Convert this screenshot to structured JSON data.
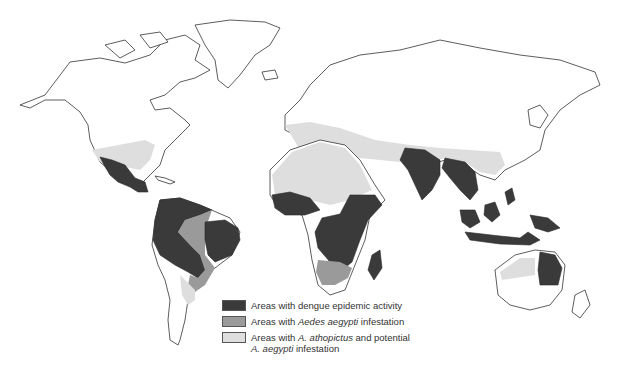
{
  "map": {
    "type": "world choropleth",
    "subject": "Global distribution of dengue and Aedes mosquito vectors"
  },
  "legend": {
    "items": [
      {
        "key": "dengue_epidemic",
        "parts": [
          "Areas with dengue epidemic activity"
        ],
        "color": "#3a3a3a"
      },
      {
        "key": "aedes_aegypti",
        "parts": [
          "Areas with ",
          "Aedes aegypti",
          " infestation"
        ],
        "color": "#9a9a9a"
      },
      {
        "key": "albopictus",
        "parts": [
          "Areas with ",
          "A. albopictus",
          " and potential",
          "A. aegypti",
          " infestation"
        ],
        "color": "#dedede"
      }
    ],
    "labels": {
      "item1": "Areas with dengue epidemic activity",
      "item2_pre": "Areas with ",
      "item2_em": "Aedes aegypti",
      "item2_post": " infestation",
      "item3_pre": "Areas with ",
      "item3_em": "A. athopictus",
      "item3_post": " and potential",
      "item3_line2_em": "A. aegypti",
      "item3_line2_post": " infestation"
    }
  },
  "colors": {
    "epidemic": "#3a3a3a",
    "aegypti": "#9a9a9a",
    "albopictus": "#dedede",
    "outline": "#333333"
  }
}
